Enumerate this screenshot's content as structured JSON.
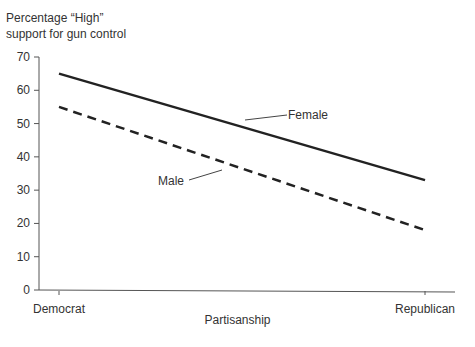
{
  "chart_data": {
    "type": "line",
    "title": "",
    "ylabel": "Percentage “High” support for gun control",
    "ylabel_lines": [
      "Percentage “High”",
      "support for gun control"
    ],
    "xlabel": "Partisanship",
    "categories": [
      "Democrat",
      "Republican"
    ],
    "ylim": [
      0,
      70
    ],
    "yticks": [
      0,
      10,
      20,
      30,
      40,
      50,
      60,
      70
    ],
    "grid": false,
    "legend": "inline annotations",
    "series": [
      {
        "name": "Female",
        "style": "solid",
        "values": [
          65,
          33
        ]
      },
      {
        "name": "Male",
        "style": "dashed",
        "values": [
          55,
          18
        ]
      }
    ],
    "colors": {
      "line": "#222222",
      "axis": "#555555",
      "text": "#333333"
    }
  }
}
